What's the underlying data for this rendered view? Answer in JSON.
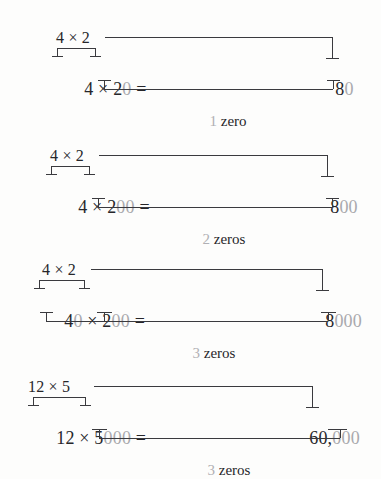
{
  "figure": {
    "colors": {
      "ink": "#26262a",
      "muted_zero": "#a9a9ad",
      "rule": "#3a3a3e",
      "background": "#fdfdfc"
    },
    "blocks": [
      {
        "id": "block-1",
        "top_expression": "4 × 2",
        "main_lead_dark": "4 × 2",
        "main_zeros": "0",
        "main_equals": " =",
        "result_dark": "8",
        "result_zeros": "0",
        "caption_count": "1",
        "caption_word": "zero"
      },
      {
        "id": "block-2",
        "top_expression": "4 × 2",
        "main_lead_dark": "4 × 2",
        "main_zeros": "00",
        "main_equals": " =",
        "result_dark": "8",
        "result_zeros": "00",
        "caption_count": "2",
        "caption_word": "zeros"
      },
      {
        "id": "block-3",
        "top_expression": "4 × 2",
        "main_lead_dark": "4",
        "main_mid_zeros": "0",
        "main_mid_dark": " × 2",
        "main_zeros": "00",
        "main_equals": " =",
        "result_dark": "8",
        "result_zeros": "000",
        "caption_count": "3",
        "caption_word": "zeros"
      },
      {
        "id": "block-4",
        "top_expression": "12 × 5",
        "main_lead_dark": "12 × 5",
        "main_zeros": "000",
        "main_equals": " =",
        "result_dark": "60,",
        "result_zeros": "000",
        "caption_count": "3",
        "caption_word": "zeros"
      }
    ]
  }
}
